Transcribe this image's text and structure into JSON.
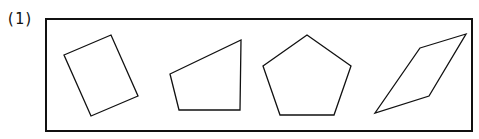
{
  "problem_label": "(1)",
  "box": {
    "x": 46,
    "y": 19,
    "w": 426,
    "h": 112
  },
  "shapes": [
    {
      "name": "rectangle",
      "points": "64,55 111,35 138,96 91,116"
    },
    {
      "name": "trapezoid",
      "points": "170,74 241,40 240,110 179,110"
    },
    {
      "name": "pentagon",
      "points": "307,35 351,66 334,115 280,115 263,66"
    },
    {
      "name": "parallelogram",
      "points": "420,48 466,34 429,96 375,113"
    }
  ],
  "colors": {
    "stroke": "#111111"
  }
}
